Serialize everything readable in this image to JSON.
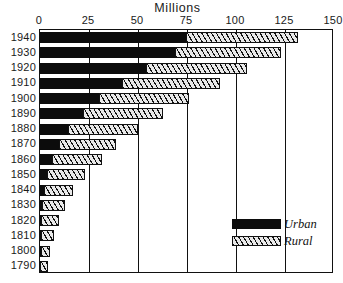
{
  "chart_data": {
    "type": "bar",
    "orientation": "horizontal",
    "stacked": true,
    "title": "Millions",
    "xlabel": "",
    "ylabel": "",
    "xlim": [
      0,
      150
    ],
    "xticks": [
      0,
      25,
      50,
      75,
      100,
      125,
      150
    ],
    "xtick_labels": [
      "0",
      "25",
      "50",
      "75",
      "100",
      "125",
      "150"
    ],
    "grid": true,
    "grid_axis": "x",
    "legend_position": "inside-lower-right",
    "categories": [
      "1940",
      "1930",
      "1920",
      "1910",
      "1900",
      "1890",
      "1880",
      "1870",
      "1860",
      "1850",
      "1840",
      "1830",
      "1820",
      "1810",
      "1800",
      "1790"
    ],
    "series": [
      {
        "name": "Urban",
        "color": "#0c0c0c",
        "fill": "solid",
        "values": [
          74.4,
          69.0,
          54.2,
          42.0,
          30.2,
          22.1,
          14.1,
          9.9,
          6.2,
          3.5,
          1.8,
          1.1,
          0.7,
          0.5,
          0.3,
          0.2
        ]
      },
      {
        "name": "Rural",
        "color": "#e9e9e9",
        "fill": "diagonal-hatch",
        "values": [
          57.2,
          53.8,
          51.6,
          49.9,
          45.8,
          40.8,
          36.0,
          28.7,
          25.2,
          19.6,
          15.2,
          11.7,
          8.9,
          6.7,
          4.9,
          3.7
        ]
      }
    ],
    "totals": [
      131.6,
      122.8,
      105.8,
      91.9,
      76.0,
      62.9,
      50.1,
      38.6,
      31.4,
      23.1,
      17.0,
      12.8,
      9.6,
      7.2,
      5.2,
      3.9
    ]
  },
  "legend": {
    "items": [
      {
        "label": "Urban",
        "swatch": "solid-black-swatch"
      },
      {
        "label": "Rural",
        "swatch": "hatched-swatch"
      }
    ]
  }
}
